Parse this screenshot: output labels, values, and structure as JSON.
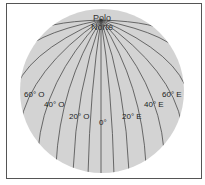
{
  "diagram": {
    "type": "globe-meridians",
    "globe_fill": "#d3d3d3",
    "line_color": "#4a4a4a",
    "pole_label": "Polo Norte",
    "meridian_labels": [
      {
        "text": "60° O",
        "x": 24,
        "y": 91
      },
      {
        "text": "40° O",
        "x": 44,
        "y": 101
      },
      {
        "text": "20° O",
        "x": 69,
        "y": 113
      },
      {
        "text": "0°",
        "x": 99,
        "y": 119
      },
      {
        "text": "20° E",
        "x": 122,
        "y": 113
      },
      {
        "text": "40° E",
        "x": 144,
        "y": 101
      },
      {
        "text": "60° E",
        "x": 162,
        "y": 91
      }
    ]
  }
}
